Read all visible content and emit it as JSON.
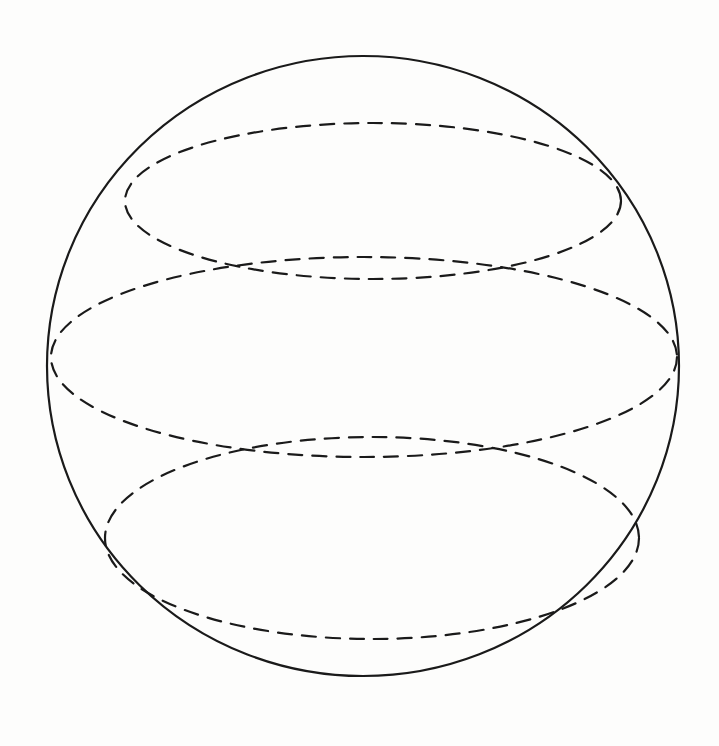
{
  "diagram": {
    "title": "",
    "shapes": [
      {
        "id": "sphere-outline",
        "kind": "circle",
        "style": "solid"
      },
      {
        "id": "top-latitude",
        "kind": "ellipse",
        "style": "dashed"
      },
      {
        "id": "equator",
        "kind": "ellipse",
        "style": "dashed"
      },
      {
        "id": "bottom-latitude",
        "kind": "ellipse",
        "style": "dashed"
      }
    ],
    "colors": {
      "stroke": "#1a1a1a",
      "background": "#fdfdfc"
    }
  }
}
